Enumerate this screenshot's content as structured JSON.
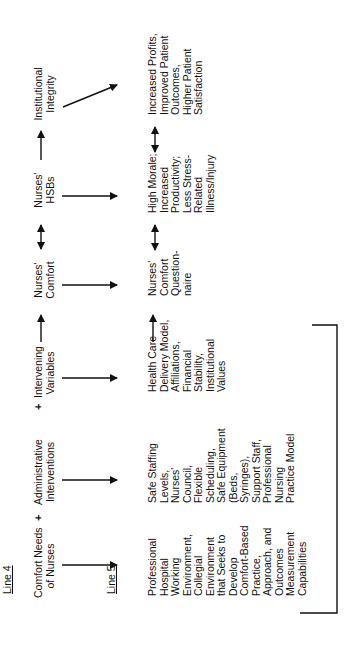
{
  "diagram": {
    "orientation": "rotated-90-ccw",
    "line4": {
      "label": "Line 4",
      "nodes": [
        {
          "id": "comfort_needs",
          "text": "Comfort Needs\nof Nurses"
        },
        {
          "id": "admin_interventions",
          "text": "Administrative\nInterventions"
        },
        {
          "id": "intervening_variables",
          "text": "Intervening\nVariables"
        },
        {
          "id": "nurses_comfort",
          "text": "Nurses'\nComfort"
        },
        {
          "id": "nurses_hsbs",
          "text": "Nurses'\nHSBs"
        },
        {
          "id": "institutional_integrity",
          "text": "Institutional\nIntegrity"
        }
      ],
      "operators": [
        "+",
        "+"
      ],
      "connectors": [
        "→",
        "↔",
        "→"
      ]
    },
    "line5": {
      "label": "Line 5",
      "nodes": [
        {
          "id": "professional_env",
          "text": "Professional\nHospital\nWorking\nEnvironment,\nCollegial\nEnvironment\nthat Seeks to\nDevelop\nComfort-Based\nPractice,\nApproach, and\nOutcomes\nMeasurement\nCapabilities"
        },
        {
          "id": "safe_staffing",
          "text": "Safe Staffing\nLevels,\nNurses'\nCouncil,\nFlexible\nScheduling,\nSafe Equipment\n(Beds,\nSyringes),\nSupport Staff,\nProfessional\nNursing\nPractice Model"
        },
        {
          "id": "health_care_delivery",
          "text": "Health Care\nDelivery Model,\nAffiliations,\nFinancial\nStability,\nInstitutional\nValues"
        },
        {
          "id": "comfort_questionnaire",
          "text": "Nurses'\nComfort\nQuestion-\nnaire"
        },
        {
          "id": "high_morale",
          "text": "High Morale;\nIncreased\nProductivity;\nLess Stress-\nRelated\nIllness/Injury"
        },
        {
          "id": "increased_profits",
          "text": "Increased Profits,\nImproved Patient\nOutcomes,\nHigher Patient\nSatisfaction"
        }
      ],
      "connectors": [
        "→",
        "↔",
        "↔"
      ]
    },
    "edges": [
      {
        "from": "comfort_needs",
        "to": "professional_env",
        "type": "down-arrow"
      },
      {
        "from": "admin_interventions",
        "to": "safe_staffing",
        "type": "down-arrow"
      },
      {
        "from": "intervening_variables",
        "to": "health_care_delivery",
        "type": "down-arrow"
      },
      {
        "from": "nurses_comfort",
        "to": "comfort_questionnaire",
        "type": "down-arrow"
      },
      {
        "from": "nurses_hsbs",
        "to": "high_morale",
        "type": "down-arrow"
      },
      {
        "from": "institutional_integrity",
        "to": "increased_profits",
        "type": "diagonal-arrow"
      }
    ],
    "bracket": {
      "spans": [
        "professional_env",
        "safe_staffing",
        "health_care_delivery"
      ]
    }
  }
}
